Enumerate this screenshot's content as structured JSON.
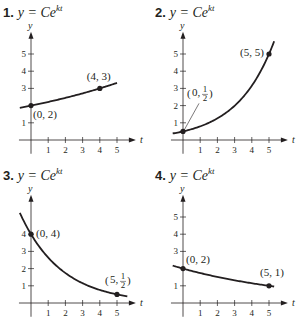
{
  "chart_data": [
    {
      "type": "line",
      "title": "1. y = Ce^{kt}",
      "number": "1.",
      "equation": "y = Ce",
      "exponent": "kt",
      "xlabel": "t",
      "ylabel": "y",
      "xticks": [
        1,
        2,
        3,
        4,
        5
      ],
      "yticks": [
        1,
        3,
        4,
        5
      ],
      "xlim": [
        -0.6,
        5.5
      ],
      "ylim": [
        -0.6,
        6
      ],
      "curve": {
        "C": 2,
        "k": 0.10137,
        "t_start": -0.65,
        "t_end": 5.0
      },
      "points": [
        {
          "x": 0,
          "y": 2,
          "label": "(0, 2)",
          "label_dx": 2,
          "label_dy": 12,
          "anchor": "start"
        },
        {
          "x": 4,
          "y": 3,
          "label": "(4, 3)",
          "label_dx": -13,
          "label_dy": -8,
          "anchor": "start"
        }
      ]
    },
    {
      "type": "line",
      "title": "2. y = Ce^{kt}",
      "number": "2.",
      "equation": "y = Ce",
      "exponent": "kt",
      "xlabel": "t",
      "ylabel": "y",
      "xticks": [
        1,
        2,
        3,
        4,
        5
      ],
      "yticks": [
        1,
        2,
        3,
        4,
        5
      ],
      "xlim": [
        -0.6,
        5.5
      ],
      "ylim": [
        -0.6,
        6
      ],
      "curve": {
        "C": 0.5,
        "k": 0.46052,
        "t_start": -0.6,
        "t_end": 5.3
      },
      "points": [
        {
          "x": 0,
          "y": 0.5,
          "label": "(0, 1/2)",
          "label_num": "1",
          "label_den": "2",
          "frac": true,
          "label_dx": 4,
          "label_dy": -38,
          "leader": true
        },
        {
          "x": 5,
          "y": 5,
          "label": "(5, 5)",
          "label_dx": -29,
          "label_dy": 2,
          "anchor": "start"
        }
      ]
    },
    {
      "type": "line",
      "title": "3. y = Ce^{kt}",
      "number": "3.",
      "equation": "y = Ce",
      "exponent": "kt",
      "xlabel": "t",
      "ylabel": "y",
      "xticks": [
        1,
        2,
        3,
        4,
        5
      ],
      "yticks": [
        1,
        2,
        3,
        4
      ],
      "xlim": [
        -0.6,
        5.5
      ],
      "ylim": [
        -0.6,
        6
      ],
      "curve": {
        "C": 4,
        "k": -0.41589,
        "t_start": -0.65,
        "t_end": 5.6
      },
      "points": [
        {
          "x": 0,
          "y": 4,
          "label": "(0, 4)",
          "label_dx": 5,
          "label_dy": 3,
          "anchor": "start"
        },
        {
          "x": 5,
          "y": 0.5,
          "label": "(5, 1/2)",
          "label_num": "1",
          "label_den": "2",
          "frac": true,
          "label_dx": -12,
          "label_dy": -14
        }
      ]
    },
    {
      "type": "line",
      "title": "4. y = Ce^{kt}",
      "number": "4.",
      "equation": "y = Ce",
      "exponent": "kt",
      "xlabel": "t",
      "ylabel": "y",
      "xticks": [
        1,
        2,
        3,
        4,
        5
      ],
      "yticks": [
        1,
        3,
        4,
        5
      ],
      "xlim": [
        -0.6,
        5.5
      ],
      "ylim": [
        -0.6,
        6
      ],
      "curve": {
        "C": 2,
        "k": -0.13863,
        "t_start": -0.6,
        "t_end": 5.3
      },
      "points": [
        {
          "x": 0,
          "y": 2,
          "label": "(0, 2)",
          "label_dx": 3,
          "label_dy": -6,
          "anchor": "start"
        },
        {
          "x": 5,
          "y": 1,
          "label": "(5, 1)",
          "label_dx": -9,
          "label_dy": -10,
          "anchor": "start"
        }
      ]
    }
  ]
}
